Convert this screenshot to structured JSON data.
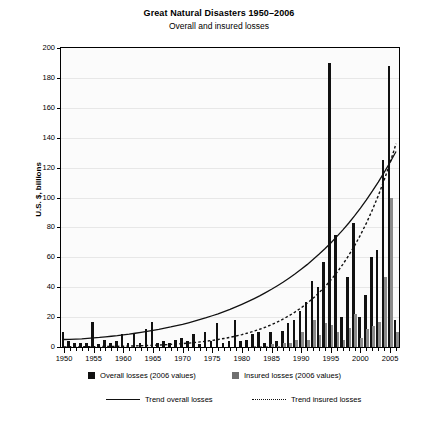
{
  "chart_data": {
    "type": "bar",
    "title": "Great Natural Disasters 1950–2006",
    "subtitle": "Overall and insured losses",
    "xlabel": "",
    "ylabel": "U.S. $, billions",
    "ylim": [
      0,
      200
    ],
    "ytick_step": 20,
    "yticks": [
      "0",
      "20",
      "40",
      "60",
      "80",
      "100",
      "120",
      "140",
      "160",
      "180",
      "200"
    ],
    "xlim": [
      1950,
      2006
    ],
    "xticks": [
      "1950",
      "1955",
      "1960",
      "1965",
      "1970",
      "1975",
      "1980",
      "1985",
      "1990",
      "1995",
      "2000",
      "2005"
    ],
    "xtick_step": 5,
    "minor_xticks_every": 1,
    "grid": false,
    "legend_position": "bottom",
    "source": "Source: Münchener Rückversicherungs-Gesellschaft Geo Risks Research, NatCat SERVICE",
    "colors": {
      "overall": "#111111",
      "insured": "#8a8a8a",
      "trend_overall": "#111111",
      "trend_insured": "#111111",
      "plot_background": "#fbfbfb",
      "axis": "#000000"
    },
    "categories": [
      1950,
      1951,
      1952,
      1953,
      1954,
      1955,
      1956,
      1957,
      1958,
      1959,
      1960,
      1961,
      1962,
      1963,
      1964,
      1965,
      1966,
      1967,
      1968,
      1969,
      1970,
      1971,
      1972,
      1973,
      1974,
      1975,
      1976,
      1977,
      1978,
      1979,
      1980,
      1981,
      1982,
      1983,
      1984,
      1985,
      1986,
      1987,
      1988,
      1989,
      1990,
      1991,
      1992,
      1993,
      1994,
      1995,
      1996,
      1997,
      1998,
      1999,
      2000,
      2001,
      2002,
      2003,
      2004,
      2005,
      2006
    ],
    "series": [
      {
        "name": "Overall losses (2006 values)",
        "values": [
          10,
          4,
          3,
          3,
          3,
          17,
          2,
          5,
          3,
          4,
          9,
          3,
          9,
          3,
          12,
          17,
          3,
          4,
          3,
          5,
          6,
          4,
          9,
          2,
          10,
          4,
          16,
          3,
          4,
          18,
          4,
          5,
          9,
          10,
          3,
          10,
          4,
          11,
          16,
          18,
          24,
          30,
          44,
          40,
          57,
          190,
          75,
          20,
          47,
          83,
          20,
          35,
          60,
          65,
          125,
          188,
          18
        ]
      },
      {
        "name": "Insured losses (2006 values)",
        "values": [
          0,
          0,
          0,
          0,
          0,
          0,
          0,
          0,
          0,
          0,
          0,
          0,
          0,
          0,
          0,
          0,
          0,
          0,
          0,
          0,
          0,
          0,
          0,
          0,
          0,
          0,
          0,
          0,
          0,
          0,
          0,
          0,
          1,
          1,
          1,
          2,
          1,
          3,
          3,
          5,
          10,
          5,
          18,
          8,
          16,
          15,
          10,
          5,
          13,
          22,
          6,
          12,
          14,
          17,
          47,
          100,
          10
        ]
      }
    ],
    "trends": [
      {
        "name": "Trend overall losses",
        "style": "solid",
        "values": [
          5,
          5.1,
          5.3,
          5.5,
          5.8,
          6.1,
          6.4,
          6.8,
          7.2,
          7.6,
          8.1,
          8.6,
          9.2,
          9.8,
          10.4,
          11.1,
          11.8,
          12.6,
          13.4,
          14.3,
          15.2,
          16.2,
          17.3,
          18.4,
          19.6,
          20.9,
          22.2,
          23.7,
          25.2,
          26.8,
          28.5,
          30.3,
          32.2,
          34.2,
          36.4,
          38.6,
          41,
          43.5,
          46.2,
          49,
          52,
          55.1,
          58.5,
          62,
          65.7,
          69.6,
          73.8,
          78.2,
          82.8,
          87.7,
          92.9,
          98.4,
          104.2,
          110.3,
          116.8,
          123.6,
          130.8
        ]
      },
      {
        "name": "Trend insured losses",
        "style": "dotted",
        "values": [
          0.1,
          0.12,
          0.14,
          0.17,
          0.2,
          0.24,
          0.28,
          0.33,
          0.39,
          0.45,
          0.53,
          0.62,
          0.72,
          0.84,
          0.97,
          1.12,
          1.3,
          1.5,
          1.73,
          1.99,
          2.28,
          2.61,
          2.99,
          3.41,
          3.89,
          4.43,
          5.04,
          5.72,
          6.48,
          7.33,
          8.29,
          9.35,
          10.54,
          11.86,
          13.33,
          14.96,
          16.77,
          18.78,
          21.01,
          23.48,
          26.21,
          29.23,
          32.56,
          36.24,
          40.3,
          44.78,
          49.71,
          55.14,
          61.12,
          67.7,
          74.93,
          82.88,
          91.61,
          101.2,
          111.7,
          123.3,
          136
        ]
      }
    ],
    "legend": [
      {
        "label": "Overall losses (2006 values)",
        "marker": "square-dark"
      },
      {
        "label": "Insured losses (2006 values)",
        "marker": "square-grey"
      },
      {
        "label": "Trend overall losses",
        "marker": "solid-line"
      },
      {
        "label": "Trend insured losses",
        "marker": "dotted-line"
      }
    ]
  }
}
